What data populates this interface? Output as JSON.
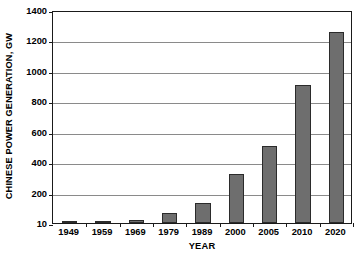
{
  "chart_data": {
    "type": "bar",
    "title": "",
    "subtitle": "",
    "xlabel": "YEAR",
    "ylabel": "CHINESE POWER GENERATION, GW",
    "categories": [
      "1949",
      "1959",
      "1969",
      "1979",
      "1989",
      "2000",
      "2005",
      "2010",
      "2020"
    ],
    "values": [
      1,
      10,
      20,
      63,
      130,
      320,
      508,
      908,
      1258
    ],
    "series": [
      {
        "name": "Chinese power generation",
        "values": [
          1,
          10,
          20,
          63,
          130,
          320,
          508,
          908,
          1258
        ]
      }
    ],
    "ylim": [
      0,
      1400
    ],
    "ytick_values": [
      0,
      200,
      400,
      600,
      800,
      1000,
      1200,
      1400
    ],
    "ytick_labels": [
      "10",
      "200",
      "400",
      "600",
      "800",
      "1000",
      "1200",
      "1400"
    ],
    "grid": "horizontal",
    "legend": "none",
    "bar_color": "#6e6e6e",
    "bar_edge_color": "#2b2b2b",
    "gridline_color": "#8a8a8a",
    "frame_color": "#1a1a1a",
    "background_color": "#ffffff",
    "annotations": []
  }
}
